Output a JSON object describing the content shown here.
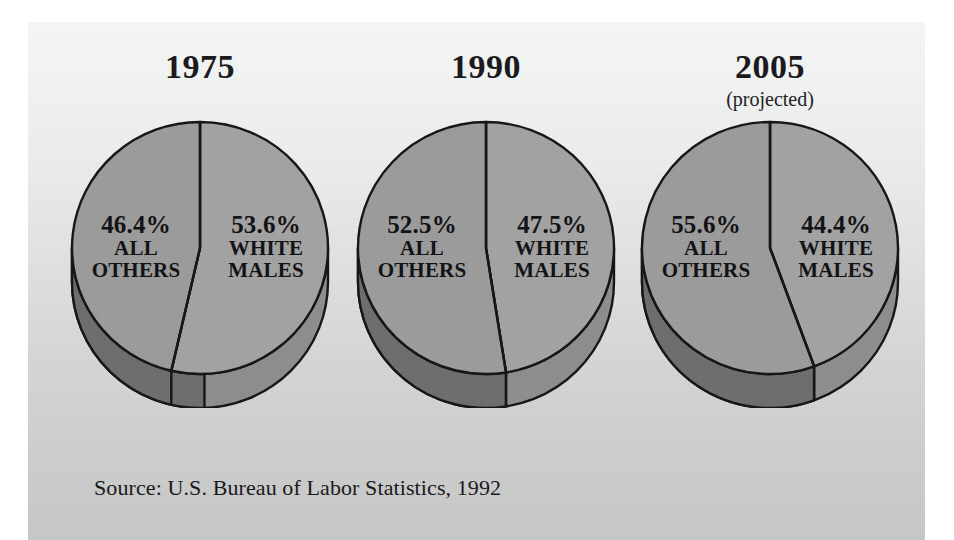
{
  "figure": {
    "source_note": "Source: U.S. Bureau of Labor Statistics, 1992",
    "panel_background_top": "#f6f7f7",
    "panel_background_bottom": "#c7c8c8",
    "outer_background": "#ffffff"
  },
  "chart_data": {
    "type": "pie",
    "title": "",
    "subtitle": "",
    "note": "Composition of the U.S. labor force: white males versus all others",
    "legend_position": "in-slice labels",
    "grid": false,
    "colors": {
      "slice_all_others": "#9c9c9c",
      "slice_white_males": "#a3a3a3",
      "rim_dark": "#6d6d6d",
      "rim_light": "#8e8e8e",
      "outline": "#141414"
    },
    "charts": [
      {
        "year": "1975",
        "projected_label": "",
        "slices": [
          {
            "label_line1": "ALL",
            "label_line2": "OTHERS",
            "value": 46.4,
            "value_text": "46.4%",
            "side": "left"
          },
          {
            "label_line1": "WHITE",
            "label_line2": "MALES",
            "value": 53.6,
            "value_text": "53.6%",
            "side": "right"
          }
        ]
      },
      {
        "year": "1990",
        "projected_label": "",
        "slices": [
          {
            "label_line1": "ALL",
            "label_line2": "OTHERS",
            "value": 52.5,
            "value_text": "52.5%",
            "side": "left"
          },
          {
            "label_line1": "WHITE",
            "label_line2": "MALES",
            "value": 47.5,
            "value_text": "47.5%",
            "side": "right"
          }
        ]
      },
      {
        "year": "2005",
        "projected_label": "(projected)",
        "slices": [
          {
            "label_line1": "ALL",
            "label_line2": "OTHERS",
            "value": 55.6,
            "value_text": "55.6%",
            "side": "left"
          },
          {
            "label_line1": "WHITE",
            "label_line2": "MALES",
            "value": 44.4,
            "value_text": "44.4%",
            "side": "right"
          }
        ]
      }
    ]
  }
}
